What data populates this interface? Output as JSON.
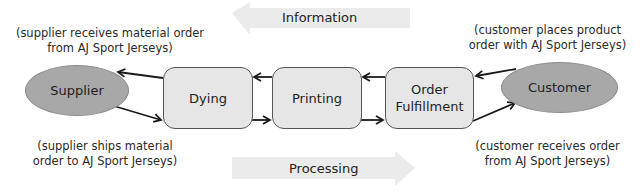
{
  "flows": {
    "information": {
      "label": "Information",
      "direction": "left",
      "color": "#eaeaea"
    },
    "processing": {
      "label": "Processing",
      "direction": "right",
      "color": "#eaeaea"
    }
  },
  "nodes": {
    "supplier": {
      "label": "Supplier",
      "shape": "ellipse",
      "fill": "#a8a8a8"
    },
    "dying": {
      "label": "Dying",
      "shape": "rounded-rect",
      "fill": "#e6e6e6"
    },
    "printing": {
      "label": "Printing",
      "shape": "rounded-rect",
      "fill": "#e6e6e6"
    },
    "order_fulfillment": {
      "label_line1": "Order",
      "label_line2": "Fulfillment",
      "shape": "rounded-rect",
      "fill": "#e6e6e6"
    },
    "customer": {
      "label": "Customer",
      "shape": "ellipse",
      "fill": "#a8a8a8"
    }
  },
  "notes": {
    "supplier_top": {
      "line1": "(supplier receives material order",
      "line2": "from AJ Sport Jerseys)"
    },
    "supplier_bottom": {
      "line1": "(supplier ships material",
      "line2": "order to AJ Sport Jerseys)"
    },
    "customer_top": {
      "line1": "(customer places product",
      "line2": "order with AJ Sport Jerseys)"
    },
    "customer_bottom": {
      "line1": "(customer receives order",
      "line2": "from AJ Sport Jerseys)"
    }
  },
  "edges": [
    {
      "from": "customer",
      "to": "order_fulfillment",
      "row": "top"
    },
    {
      "from": "order_fulfillment",
      "to": "printing",
      "row": "top"
    },
    {
      "from": "printing",
      "to": "dying",
      "row": "top"
    },
    {
      "from": "dying",
      "to": "supplier",
      "row": "top"
    },
    {
      "from": "supplier",
      "to": "dying",
      "row": "bottom"
    },
    {
      "from": "dying",
      "to": "printing",
      "row": "bottom"
    },
    {
      "from": "printing",
      "to": "order_fulfillment",
      "row": "bottom"
    },
    {
      "from": "order_fulfillment",
      "to": "customer",
      "row": "bottom"
    }
  ]
}
